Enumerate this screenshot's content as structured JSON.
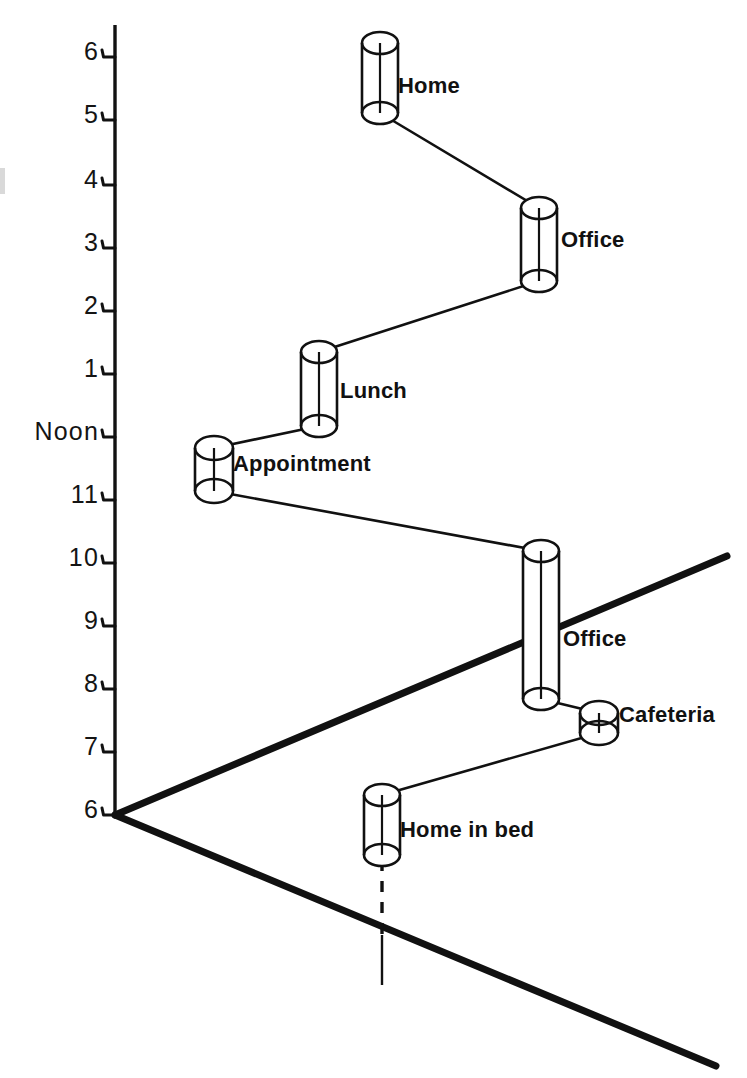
{
  "figure": {
    "kind": "space-time-path-diagram",
    "background_color": "#ffffff",
    "ink_color": "#111111",
    "width": 747,
    "height": 1078
  },
  "axis": {
    "name": "time-axis",
    "orientation": "vertical",
    "x": 115,
    "top_y": 25,
    "bottom_y": 815,
    "tick_side": "left",
    "ticks": [
      {
        "label": "6",
        "y": 57,
        "meaning": "6 PM"
      },
      {
        "label": "5",
        "y": 120,
        "meaning": "5 PM"
      },
      {
        "label": "4",
        "y": 185,
        "meaning": "4 PM"
      },
      {
        "label": "3",
        "y": 248,
        "meaning": "3 PM"
      },
      {
        "label": "2",
        "y": 311,
        "meaning": "2 PM"
      },
      {
        "label": "1",
        "y": 374,
        "meaning": "1 PM"
      },
      {
        "label": "Noon",
        "y": 437,
        "meaning": "12 PM"
      },
      {
        "label": "11",
        "y": 500,
        "meaning": "11 AM"
      },
      {
        "label": "10",
        "y": 563,
        "meaning": "10 AM"
      },
      {
        "label": "9",
        "y": 626,
        "meaning": "9 AM"
      },
      {
        "label": "8",
        "y": 689,
        "meaning": "8 AM"
      },
      {
        "label": "7",
        "y": 752,
        "meaning": "7 AM"
      },
      {
        "label": "6",
        "y": 815,
        "meaning": "6 AM"
      }
    ]
  },
  "ground_plane": {
    "name": "ground-plane",
    "origin": {
      "x": 115,
      "y": 815
    },
    "edges": [
      {
        "name": "ground-edge-right-up",
        "x1": 115,
        "y1": 815,
        "x2": 727,
        "y2": 556
      },
      {
        "name": "ground-edge-right-down",
        "x1": 115,
        "y1": 815,
        "x2": 716,
        "y2": 1066
      }
    ],
    "line_width": 7
  },
  "stations": [
    {
      "id": "home-evening",
      "label": "Home",
      "cx": 380,
      "top_y": 43,
      "bottom_y": 113,
      "radius_x": 18,
      "radius_y": 11,
      "label_x": 398,
      "label_y": 88,
      "start_time": "6 PM",
      "end_time": "5 PM"
    },
    {
      "id": "office-afternoon",
      "label": "Office",
      "cx": 539,
      "top_y": 208,
      "bottom_y": 281,
      "radius_x": 18,
      "radius_y": 11,
      "label_x": 561,
      "label_y": 242,
      "start_time": "4 PM",
      "end_time": "2:45 PM"
    },
    {
      "id": "lunch",
      "label": "Lunch",
      "cx": 319,
      "top_y": 352,
      "bottom_y": 426,
      "radius_x": 18,
      "radius_y": 11,
      "label_x": 340,
      "label_y": 393,
      "start_time": "1:15 PM",
      "end_time": "Noon"
    },
    {
      "id": "appointment",
      "label": "Appointment",
      "cx": 214,
      "top_y": 448,
      "bottom_y": 491,
      "radius_x": 19,
      "radius_y": 12,
      "label_x": 233,
      "label_y": 466,
      "start_time": "11:50 AM",
      "end_time": "11:25 AM"
    },
    {
      "id": "office-morning",
      "label": "Office",
      "cx": 541,
      "top_y": 551,
      "bottom_y": 699,
      "radius_x": 18,
      "radius_y": 11,
      "label_x": 563,
      "label_y": 641,
      "start_time": "10:10 AM",
      "end_time": "7:50 AM"
    },
    {
      "id": "cafeteria",
      "label": "Cafeteria",
      "cx": 599,
      "top_y": 713,
      "bottom_y": 733,
      "radius_x": 19,
      "radius_y": 12,
      "label_x": 619,
      "label_y": 717,
      "start_time": "7:35 AM",
      "end_time": "7:20 AM"
    },
    {
      "id": "home-in-bed",
      "label": "Home in bed",
      "cx": 382,
      "top_y": 795,
      "bottom_y": 855,
      "radius_x": 18,
      "radius_y": 11,
      "label_x": 400,
      "label_y": 832,
      "start_time": "6:50 AM",
      "end_time": "6 AM"
    }
  ],
  "travel_segments": [
    {
      "name": "home-to-office-pm",
      "from": "office-afternoon",
      "to": "home-evening",
      "x1": 539,
      "y1": 208,
      "x2": 380,
      "y2": 113
    },
    {
      "name": "lunch-to-office-pm",
      "from": "lunch",
      "to": "office-afternoon",
      "x1": 319,
      "y1": 352,
      "x2": 539,
      "y2": 281
    },
    {
      "name": "appointment-to-lunch",
      "from": "appointment",
      "to": "lunch",
      "x1": 214,
      "y1": 448,
      "x2": 319,
      "y2": 426
    },
    {
      "name": "office-am-to-appointment",
      "from": "office-morning",
      "to": "appointment",
      "x1": 541,
      "y1": 551,
      "x2": 214,
      "y2": 491
    },
    {
      "name": "cafeteria-to-office-am",
      "from": "cafeteria",
      "to": "office-morning",
      "x1": 599,
      "y1": 713,
      "x2": 541,
      "y2": 699
    },
    {
      "name": "bed-to-cafeteria",
      "from": "home-in-bed",
      "to": "cafeteria",
      "x1": 382,
      "y1": 795,
      "x2": 599,
      "y2": 733
    }
  ],
  "drop_line": {
    "name": "home-drop-line",
    "x": 382,
    "dashed_from_y": 860,
    "dashed_to_y": 935,
    "solid_from_y": 935,
    "solid_to_y": 985
  }
}
